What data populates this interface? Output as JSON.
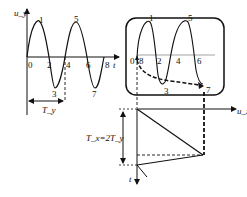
{
  "diagram": {
    "left_plot": {
      "y_axis_label": "u_y",
      "x_axis_label": "t",
      "tick_labels": [
        "0",
        "2",
        "4",
        "6",
        "8"
      ],
      "point_labels": [
        "1",
        "3",
        "5",
        "7"
      ],
      "period_label": "T_y"
    },
    "screen": {
      "trace_labels": [
        "0",
        "8",
        "1",
        "2",
        "3",
        "4",
        "5",
        "6",
        "7"
      ],
      "label_0_8": "0",
      "label_8": "8"
    },
    "sweep_plot": {
      "x_axis_label": "u_x",
      "y_axis_label": "t",
      "period_label": "T_x=2T_y"
    },
    "colors": {
      "stroke": "#111111",
      "grid_line": "#999999",
      "background": "#ffffff"
    }
  }
}
